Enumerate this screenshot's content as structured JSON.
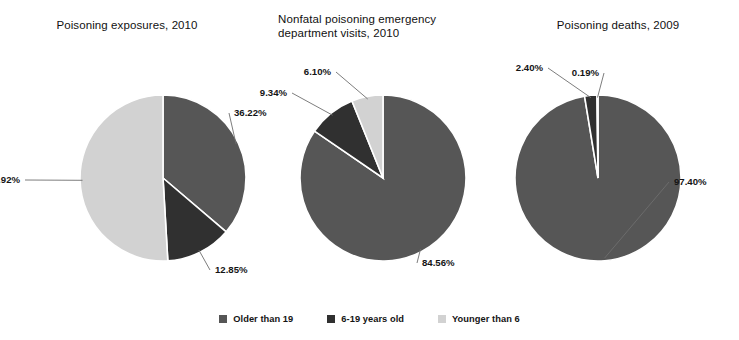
{
  "chart_data": [
    {
      "type": "pie",
      "title": "Poisoning exposures, 2010",
      "categories": [
        "Older than 19",
        "6-19 years old",
        "Younger than 6"
      ],
      "values": [
        36.22,
        12.85,
        50.92
      ],
      "labels": [
        "36.22%",
        "12.85%",
        "50.92%"
      ],
      "colors": [
        "#565656",
        "#303030",
        "#d2d2d2"
      ],
      "start_angle_deg": 0,
      "direction": "clockwise",
      "legend_position": "bottom",
      "xlabel": "",
      "ylabel": ""
    },
    {
      "type": "pie",
      "title": "Nonfatal poisoning emergency\ndepartment visits, 2010",
      "categories": [
        "Older than 19",
        "6-19 years old",
        "Younger than 6"
      ],
      "values": [
        84.56,
        9.34,
        6.1
      ],
      "labels": [
        "84.56%",
        "9.34%",
        "6.10%"
      ],
      "colors": [
        "#565656",
        "#303030",
        "#d2d2d2"
      ],
      "start_angle_deg": 0,
      "direction": "clockwise",
      "legend_position": "bottom",
      "xlabel": "",
      "ylabel": ""
    },
    {
      "type": "pie",
      "title": "Poisoning deaths, 2009",
      "categories": [
        "Older than 19",
        "6-19 years old",
        "Younger than 6"
      ],
      "values": [
        97.4,
        2.4,
        0.19
      ],
      "labels": [
        "97.40%",
        "2.40%",
        "0.19%"
      ],
      "colors": [
        "#565656",
        "#303030",
        "#d2d2d2"
      ],
      "start_angle_deg": 0,
      "direction": "clockwise",
      "legend_position": "bottom",
      "xlabel": "",
      "ylabel": ""
    }
  ],
  "legend": {
    "items": [
      {
        "label": "Older than 19",
        "color": "#565656"
      },
      {
        "label": "6-19 years old",
        "color": "#303030"
      },
      {
        "label": "Younger than 6",
        "color": "#d2d2d2"
      }
    ]
  },
  "layout": {
    "background": "#ffffff",
    "pie_radius": 83,
    "centers": [
      {
        "cx": 163,
        "cy": 178
      },
      {
        "cx": 383,
        "cy": 178
      },
      {
        "cx": 598,
        "cy": 178
      }
    ],
    "label_anchors": [
      [
        {
          "x": 232,
          "y": 113,
          "side": "right"
        },
        {
          "x": 213,
          "y": 270,
          "side": "right"
        },
        {
          "x": 22,
          "y": 180,
          "side": "left"
        }
      ],
      [
        {
          "x": 420,
          "y": 263,
          "side": "right"
        },
        {
          "x": 289,
          "y": 93,
          "side": "left"
        },
        {
          "x": 333,
          "y": 72,
          "side": "left"
        }
      ],
      [
        {
          "x": 672,
          "y": 182,
          "side": "right"
        },
        {
          "x": 545,
          "y": 68,
          "side": "left"
        },
        {
          "x": 601,
          "y": 73,
          "side": "left"
        }
      ]
    ]
  }
}
